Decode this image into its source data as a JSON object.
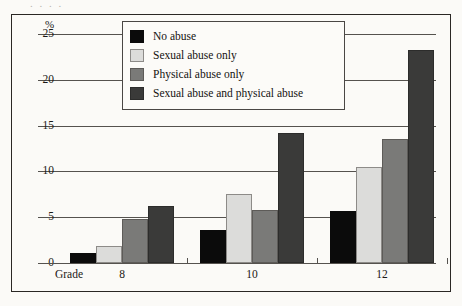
{
  "figure": {
    "background_color": "#fbfaf7",
    "border_color": "#2a2724",
    "top_cutoff_text": ". . . ."
  },
  "legend": {
    "position": "top-center",
    "entries": [
      {
        "label": "No abuse",
        "color": "#0b0b0b",
        "swatch_name": "legend-swatch-no-abuse"
      },
      {
        "label": "Sexual abuse only",
        "color": "#dcdcda",
        "swatch_name": "legend-swatch-sexual-abuse-only"
      },
      {
        "label": "Physical abuse only",
        "color": "#7a7a78",
        "swatch_name": "legend-swatch-physical-abuse-only"
      },
      {
        "label": "Sexual abuse and physical abuse",
        "color": "#3a3a39",
        "swatch_name": "legend-swatch-sexual-and-physical-abuse"
      }
    ]
  },
  "axes": {
    "y_unit_symbol": "%",
    "y_ticks": [
      "25",
      "20",
      "15",
      "10",
      "5",
      "0"
    ],
    "x_axis_prefix_label": "Grade",
    "x_tick_labels": [
      "8",
      "10",
      "12"
    ]
  },
  "chart_data": {
    "type": "bar",
    "title": "",
    "xlabel": "Grade",
    "ylabel": "%",
    "ylim": [
      0,
      25
    ],
    "yticks": [
      0,
      5,
      10,
      15,
      20,
      25
    ],
    "grid": true,
    "legend_position": "top-center",
    "categories": [
      "8",
      "10",
      "12"
    ],
    "series": [
      {
        "name": "No abuse",
        "color": "#0b0b0b",
        "values": [
          1.1,
          3.6,
          5.7
        ]
      },
      {
        "name": "Sexual abuse only",
        "color": "#dcdcda",
        "values": [
          1.9,
          7.5,
          10.5
        ]
      },
      {
        "name": "Physical abuse only",
        "color": "#7a7a78",
        "values": [
          4.8,
          5.8,
          13.5
        ]
      },
      {
        "name": "Sexual abuse and physical abuse",
        "color": "#3a3a39",
        "values": [
          6.2,
          14.2,
          23.2
        ]
      }
    ]
  }
}
